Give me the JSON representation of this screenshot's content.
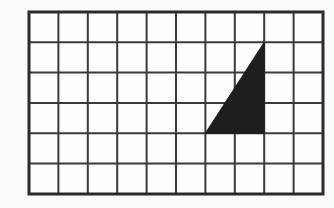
{
  "figure": {
    "canvas_width": 334,
    "canvas_height": 208,
    "background_color": "#fbfbf9"
  },
  "grid": {
    "columns": 10,
    "rows": 6,
    "origin_x": 29,
    "origin_y": 12,
    "cell_width": 29.4,
    "cell_height": 30.3,
    "width": 294,
    "height": 182,
    "line_color": "#3a3a3a",
    "line_width": 2,
    "border_color": "#2b2b2b",
    "border_width": 3,
    "cell_fill": "#fdfdfb"
  },
  "shape": {
    "name": "right-triangle",
    "fill_color": "#1e1e1e",
    "stroke_color": "#1e1e1e",
    "vertices_grid": [
      {
        "col": 6,
        "row": 4
      },
      {
        "col": 8,
        "row": 4
      },
      {
        "col": 8,
        "row": 1
      }
    ],
    "vertices_px": [
      {
        "x": 205.4,
        "y": 133.2
      },
      {
        "x": 264.2,
        "y": 133.2
      },
      {
        "x": 264.2,
        "y": 42.3
      }
    ],
    "base_cells": 2,
    "height_cells": 3,
    "area_cells": 3
  }
}
